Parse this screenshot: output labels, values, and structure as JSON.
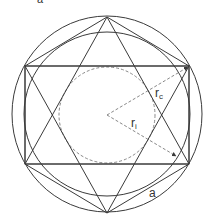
{
  "figure": {
    "top_label": "a",
    "labels": {
      "circumradius": "r",
      "circumradius_sub": "c",
      "inradius": "r",
      "inradius_sub": "i",
      "side": "a"
    },
    "colors": {
      "stroke": "#3a3a3a",
      "dashed": "#7a7a7a",
      "background": "#ffffff"
    },
    "elements": [
      "outer-circumcircle",
      "inner-circle",
      "dashed-incircle",
      "rectangle",
      "hexagram-triangle-up",
      "hexagram-triangle-down",
      "hexagon",
      "circumradius-arrow",
      "inradius-arrow"
    ]
  }
}
